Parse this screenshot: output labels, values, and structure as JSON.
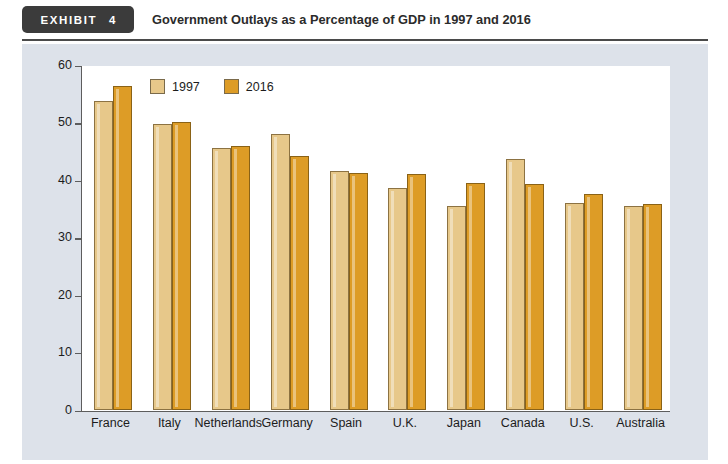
{
  "header": {
    "badge_word": "EXHIBIT",
    "badge_number": "4",
    "title": "Government Outlays as a Percentage of GDP in 1997 and 2016"
  },
  "colors": {
    "series_1997": "#e7c88a",
    "series_2016": "#dd9c26",
    "panel_background": "#dde2ea",
    "plot_background": "#ffffff",
    "axis": "#5d5d5d",
    "badge_background": "#3b3b3b"
  },
  "chart_data": {
    "type": "bar",
    "title": "Government Outlays as a Percentage of GDP in 1997 and 2016",
    "xlabel": "",
    "ylabel": "Government outlays (percentage of GDP)",
    "ylim": [
      0,
      60
    ],
    "ytick_labels": [
      "60",
      "50",
      "40",
      "30",
      "20",
      "10",
      "0"
    ],
    "ytick_values": [
      60,
      50,
      40,
      30,
      20,
      10,
      0
    ],
    "grid": false,
    "legend_position": "top-left inside plot",
    "categories": [
      "France",
      "Italy",
      "Netherlands",
      "Germany",
      "Spain",
      "U.K.",
      "Japan",
      "Canada",
      "U.S.",
      "Australia"
    ],
    "series": [
      {
        "name": "1997",
        "color": "#e7c88a",
        "values": [
          53.8,
          49.7,
          45.6,
          47.9,
          41.6,
          38.5,
          35.4,
          43.6,
          35.9,
          35.4
        ]
      },
      {
        "name": "2016",
        "color": "#dd9c26",
        "values": [
          56.3,
          50.0,
          45.9,
          44.1,
          41.2,
          41.1,
          39.5,
          39.3,
          37.6,
          35.8
        ]
      }
    ]
  }
}
